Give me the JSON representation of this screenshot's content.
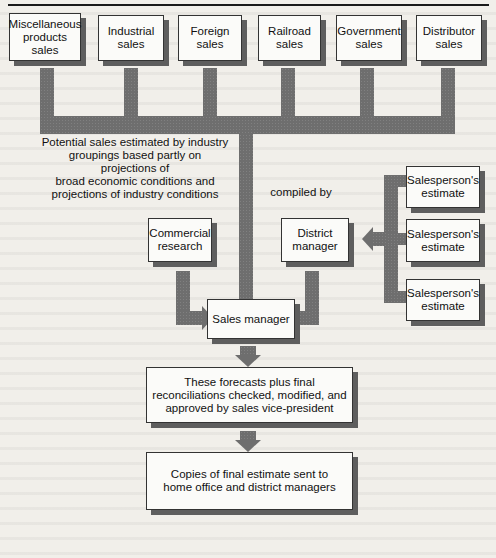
{
  "diagram": {
    "title": "",
    "top_row": [
      {
        "id": "misc",
        "label": "Miscellaneous\nproducts\nsales"
      },
      {
        "id": "industrial",
        "label": "Industrial\nsales"
      },
      {
        "id": "foreign",
        "label": "Foreign\nsales"
      },
      {
        "id": "railroad",
        "label": "Railroad\nsales"
      },
      {
        "id": "government",
        "label": "Government\nsales"
      },
      {
        "id": "distributor",
        "label": "Distributor\nsales"
      }
    ],
    "potential_note": "Potential sales estimated by industry\ngroupings based partly on projections of\nbroad economic conditions and\nprojections of industry conditions",
    "compiled_by": "compiled by",
    "commercial_research": "Commercial\nresearch",
    "district_manager": "District\nmanager",
    "salesperson_estimates": [
      {
        "label": "Salesperson's\nestimate"
      },
      {
        "label": "Salesperson's\nestimate"
      },
      {
        "label": "Salesperson's\nestimate"
      }
    ],
    "sales_manager": "Sales manager",
    "reconciliation": "These forecasts plus final\nreconciliations checked, modified, and\napproved by sales vice-president",
    "final_copies": "Copies of final estimate sent to\nhome office and district managers"
  },
  "colors": {
    "connector": "#6e6e6e",
    "box_fill": "#fbfbf9",
    "box_shadow": "#5e5e5e",
    "page": "#f1efea"
  }
}
